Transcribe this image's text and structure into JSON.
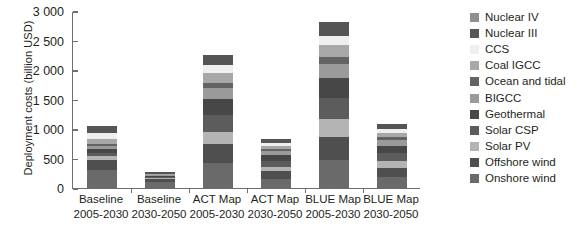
{
  "chart_data": {
    "type": "bar",
    "stacked": true,
    "title": "",
    "xlabel": "",
    "ylabel": "Deployment costs (billion USD)",
    "ylim": [
      0,
      3000
    ],
    "yticks": [
      "0",
      "500",
      "1 000",
      "1 500",
      "2 000",
      "2 500",
      "3 000"
    ],
    "ytick_values": [
      0,
      500,
      1000,
      1500,
      2000,
      2500,
      3000
    ],
    "grid": false,
    "legend_position": "right",
    "categories": [
      "Baseline 2005-2030",
      "Baseline 2030-2050",
      "ACT Map 2005-2030",
      "ACT Map 2030-2050",
      "BLUE Map 2005-2030",
      "BLUE Map 2030-2050"
    ],
    "category_lines": [
      {
        "line1": "Baseline",
        "line2": "2005-2030"
      },
      {
        "line1": "Baseline",
        "line2": "2030-2050"
      },
      {
        "line1": "ACT Map",
        "line2": "2005-2030"
      },
      {
        "line1": "ACT Map",
        "line2": "2030-2050"
      },
      {
        "line1": "BLUE Map",
        "line2": "2005-2030"
      },
      {
        "line1": "BLUE Map",
        "line2": "2030-2050"
      }
    ],
    "series": [
      {
        "name": "Onshore wind",
        "color": "#6a6a6a",
        "values": [
          300,
          110,
          420,
          160,
          480,
          185
        ]
      },
      {
        "name": "Offshore wind",
        "color": "#4f4f4f",
        "values": [
          175,
          35,
          330,
          120,
          390,
          150
        ]
      },
      {
        "name": "Solar PV",
        "color": "#b4b4b4",
        "values": [
          65,
          20,
          200,
          75,
          300,
          115
        ]
      },
      {
        "name": "Solar CSP",
        "color": "#5c5c5c",
        "values": [
          60,
          20,
          290,
          105,
          360,
          140
        ]
      },
      {
        "name": "Geothermal",
        "color": "#474747",
        "values": [
          55,
          15,
          265,
          95,
          330,
          130
        ]
      },
      {
        "name": "BIGCC",
        "color": "#9a9a9a",
        "values": [
          50,
          15,
          185,
          70,
          245,
          95
        ]
      },
      {
        "name": "Ocean and tidal",
        "color": "#636363",
        "values": [
          40,
          10,
          95,
          35,
          120,
          50
        ]
      },
      {
        "name": "Coal IGCC",
        "color": "#a8a8a8",
        "values": [
          95,
          10,
          170,
          60,
          200,
          75
        ]
      },
      {
        "name": "CCS",
        "color": "#efefef",
        "values": [
          90,
          10,
          125,
          45,
          150,
          60
        ]
      },
      {
        "name": "Nuclear III",
        "color": "#555555",
        "values": [
          115,
          20,
          180,
          65,
          240,
          90
        ]
      },
      {
        "name": "Nuclear IV",
        "color": "#8f8f8f",
        "values": [
          0,
          0,
          0,
          0,
          0,
          0
        ]
      }
    ],
    "totals": [
      1045,
      265,
      2260,
      830,
      2815,
      1090
    ]
  },
  "legend": {
    "items": [
      {
        "label": "Nuclear IV",
        "color": "#8f8f8f"
      },
      {
        "label": "Nuclear III",
        "color": "#555555"
      },
      {
        "label": "CCS",
        "color": "#efefef"
      },
      {
        "label": "Coal IGCC",
        "color": "#a8a8a8"
      },
      {
        "label": "Ocean and tidal",
        "color": "#636363"
      },
      {
        "label": "BIGCC",
        "color": "#9a9a9a"
      },
      {
        "label": "Geothermal",
        "color": "#474747"
      },
      {
        "label": "Solar CSP",
        "color": "#5c5c5c"
      },
      {
        "label": "Solar PV",
        "color": "#b4b4b4"
      },
      {
        "label": "Offshore wind",
        "color": "#4f4f4f"
      },
      {
        "label": "Onshore wind",
        "color": "#6a6a6a"
      }
    ]
  },
  "axis": {
    "y_title": "Deployment costs (billion USD)"
  },
  "colors": {
    "axis": "#6d6e71",
    "text": "#231f20",
    "background": "#ffffff"
  }
}
